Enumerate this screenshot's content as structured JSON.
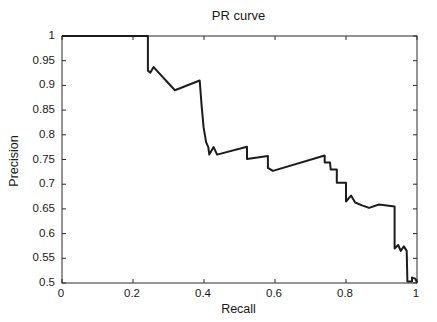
{
  "figure": {
    "background_color": "#ffffff",
    "axis_color": "#2b2b2b",
    "curve_color": "#1c1c1c",
    "text_color": "#1a1a1a"
  },
  "chart_data": {
    "type": "line",
    "title": "PR curve",
    "xlabel": "Recall",
    "ylabel": "Precision",
    "xlim": [
      0,
      1
    ],
    "ylim": [
      0.5,
      1
    ],
    "grid": false,
    "legend": null,
    "x_ticks": [
      0,
      0.2,
      0.4,
      0.6,
      0.8,
      1
    ],
    "x_tick_labels": [
      "0",
      "0.2",
      "0.4",
      "0.6",
      "0.8",
      "1"
    ],
    "y_ticks": [
      0.5,
      0.55,
      0.6,
      0.65,
      0.7,
      0.75,
      0.8,
      0.85,
      0.9,
      0.95,
      1
    ],
    "y_tick_labels": [
      "0.5",
      "0.55",
      "0.6",
      "0.65",
      "0.7",
      "0.75",
      "0.8",
      "0.85",
      "0.9",
      "0.95",
      "1"
    ],
    "series": [
      {
        "name": "PR curve",
        "points": [
          [
            0.0,
            1.0
          ],
          [
            0.242,
            1.0
          ],
          [
            0.242,
            0.93
          ],
          [
            0.249,
            0.926
          ],
          [
            0.258,
            0.937
          ],
          [
            0.318,
            0.89
          ],
          [
            0.388,
            0.91
          ],
          [
            0.393,
            0.862
          ],
          [
            0.399,
            0.815
          ],
          [
            0.406,
            0.785
          ],
          [
            0.412,
            0.775
          ],
          [
            0.415,
            0.76
          ],
          [
            0.427,
            0.775
          ],
          [
            0.437,
            0.76
          ],
          [
            0.521,
            0.776
          ],
          [
            0.521,
            0.751
          ],
          [
            0.58,
            0.757
          ],
          [
            0.58,
            0.733
          ],
          [
            0.594,
            0.727
          ],
          [
            0.74,
            0.758
          ],
          [
            0.74,
            0.744
          ],
          [
            0.755,
            0.744
          ],
          [
            0.757,
            0.73
          ],
          [
            0.774,
            0.73
          ],
          [
            0.774,
            0.703
          ],
          [
            0.8,
            0.703
          ],
          [
            0.8,
            0.665
          ],
          [
            0.814,
            0.677
          ],
          [
            0.826,
            0.663
          ],
          [
            0.845,
            0.657
          ],
          [
            0.865,
            0.652
          ],
          [
            0.893,
            0.659
          ],
          [
            0.937,
            0.655
          ],
          [
            0.937,
            0.57
          ],
          [
            0.947,
            0.577
          ],
          [
            0.954,
            0.565
          ],
          [
            0.963,
            0.574
          ],
          [
            0.971,
            0.565
          ],
          [
            0.973,
            0.503
          ],
          [
            0.986,
            0.503
          ],
          [
            0.986,
            0.511
          ],
          [
            0.995,
            0.509
          ],
          [
            1.0,
            0.501
          ]
        ]
      }
    ]
  },
  "layout_values": {
    "plot_left": 61,
    "plot_top": 35,
    "plot_width": 355,
    "plot_height": 247,
    "tick_length": 4
  }
}
